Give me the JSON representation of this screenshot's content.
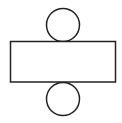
{
  "diagram": {
    "type": "cylinder-net",
    "stroke_color": "#222222",
    "fill_color": "#ffffff",
    "shapes": {
      "top_circle": {
        "cx": 63,
        "cy": 25,
        "r": 16.5
      },
      "rectangle": {
        "x": 10.5,
        "y": 41.5,
        "width": 105,
        "height": 40.5
      },
      "bottom_circle": {
        "cx": 63,
        "cy": 99,
        "r": 16.5
      }
    }
  }
}
